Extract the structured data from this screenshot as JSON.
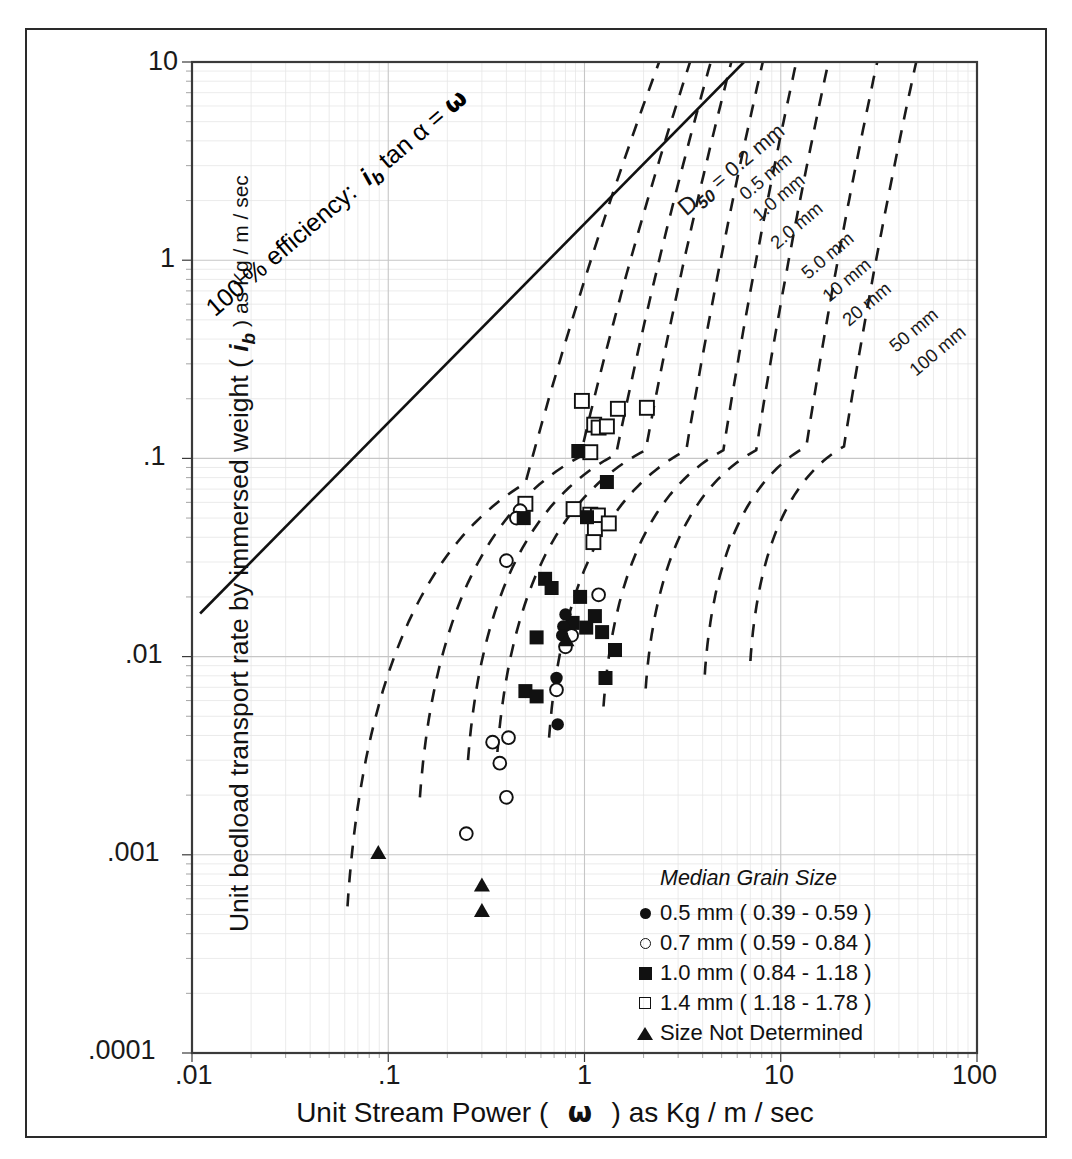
{
  "chart_data": {
    "type": "scatter",
    "title": "",
    "xlabel": "Unit Stream Power (  ω  ) as Kg / m / sec",
    "ylabel": "Unit bedload transport rate by immersed weight ( i b ) as Kg / m / sec",
    "xscale": "log",
    "yscale": "log",
    "xlim": [
      0.01,
      100
    ],
    "ylim": [
      0.0001,
      10
    ],
    "xticks": [
      ".01",
      ".1",
      "1",
      "10",
      "100"
    ],
    "yticks": [
      "10",
      "1",
      ".1",
      ".01",
      ".001",
      ".0001"
    ],
    "grid": true,
    "legend_position": "bottom-right",
    "series": [
      {
        "name": "0.5 mm ( 0.39 - 0.59 )",
        "marker": "filled-circle",
        "points": [
          [
            0.8,
            0.0163
          ],
          [
            0.78,
            0.0142
          ],
          [
            0.77,
            0.0128
          ],
          [
            0.72,
            0.0078
          ],
          [
            0.73,
            0.00455
          ]
        ]
      },
      {
        "name": "0.7 mm ( 0.59 - 0.84 )",
        "marker": "open-circle",
        "points": [
          [
            0.47,
            0.0545
          ],
          [
            0.45,
            0.05
          ],
          [
            0.4,
            0.0305
          ],
          [
            0.83,
            0.0133
          ],
          [
            0.86,
            0.0128
          ],
          [
            1.18,
            0.0205
          ],
          [
            0.8,
            0.0112
          ],
          [
            0.72,
            0.0068
          ],
          [
            0.34,
            0.0037
          ],
          [
            0.41,
            0.0039
          ],
          [
            0.37,
            0.0029
          ],
          [
            0.4,
            0.00195
          ],
          [
            0.25,
            0.00128
          ]
        ]
      },
      {
        "name": "1.0 mm ( 0.84 - 1.18 )",
        "marker": "filled-square",
        "points": [
          [
            0.93,
            0.109
          ],
          [
            1.3,
            0.076
          ],
          [
            0.49,
            0.05
          ],
          [
            1.03,
            0.0505
          ],
          [
            1.43,
            0.0108
          ],
          [
            0.63,
            0.0247
          ],
          [
            0.68,
            0.0222
          ],
          [
            0.95,
            0.02
          ],
          [
            1.13,
            0.016
          ],
          [
            0.87,
            0.0148
          ],
          [
            1.02,
            0.014
          ],
          [
            1.23,
            0.0133
          ],
          [
            0.57,
            0.0125
          ],
          [
            0.5,
            0.0067
          ],
          [
            0.57,
            0.0063
          ],
          [
            1.28,
            0.0078
          ]
        ]
      },
      {
        "name": "1.4 mm ( 1.18 - 1.78 )",
        "marker": "open-square",
        "points": [
          [
            0.97,
            0.195
          ],
          [
            1.48,
            0.178
          ],
          [
            2.08,
            0.18
          ],
          [
            1.12,
            0.148
          ],
          [
            1.18,
            0.143
          ],
          [
            1.3,
            0.145
          ],
          [
            1.07,
            0.1075
          ],
          [
            0.88,
            0.0555
          ],
          [
            1.07,
            0.052
          ],
          [
            1.17,
            0.0515
          ],
          [
            1.13,
            0.044
          ],
          [
            1.33,
            0.047
          ],
          [
            1.11,
            0.0378
          ],
          [
            0.5,
            0.059
          ]
        ]
      },
      {
        "name": "Size Not Determined",
        "marker": "filled-triangle",
        "points": [
          [
            0.089,
            0.00102
          ],
          [
            0.3,
            0.0007
          ],
          [
            0.3,
            0.00052
          ],
          [
            0.81,
            0.0121
          ]
        ]
      }
    ],
    "reference_line": {
      "label": "100 % efficiency:  i b  tan α = ω",
      "style": "solid",
      "points": [
        [
          0.011,
          0.0165
        ],
        [
          6.5,
          10.0
        ]
      ]
    },
    "curve_family_label": "D50 =",
    "curves": [
      {
        "label": "0.2 mm"
      },
      {
        "label": "0.5 mm"
      },
      {
        "label": "1.0 mm"
      },
      {
        "label": "2.0 mm"
      },
      {
        "label": "5.0 mm"
      },
      {
        "label": "10 mm"
      },
      {
        "label": "20 mm"
      },
      {
        "label": "50 mm"
      },
      {
        "label": "100 mm"
      }
    ]
  },
  "axes": {
    "x_title_pre": "Unit Stream Power  (",
    "x_title_omega": "ω",
    "x_title_post": ") as Kg / m / sec",
    "y_title_pre": "Unit bedload transport rate by immersed weight (",
    "y_title_ib": "i",
    "y_title_ib_sub": "b",
    "y_title_post": ") as Kg / m / sec",
    "x_ticks": [
      ".01",
      ".1",
      "1",
      "10",
      "100"
    ],
    "y_ticks": [
      "10",
      "1",
      ".1",
      ".01",
      ".001",
      ".0001"
    ]
  },
  "annotations": {
    "efficiency_pre": "100 % efficiency:",
    "efficiency_ib": "i",
    "efficiency_ib_sub": "b",
    "efficiency_post": "tan α =",
    "efficiency_omega": "ω",
    "d50_prefix": "D",
    "d50_sub": "50",
    "d50_eq": "= 0.2 mm",
    "curve_labels": [
      "0.5 mm",
      "1.0 mm",
      "2.0 mm",
      "5.0 mm",
      "10 mm",
      "20 mm",
      "50 mm",
      "100 mm"
    ]
  },
  "legend": {
    "title": "Median Grain Size",
    "items": [
      {
        "symbol": "filled-circle",
        "label": "0.5 mm ( 0.39 - 0.59 )"
      },
      {
        "symbol": "open-circle",
        "label": "0.7 mm ( 0.59 - 0.84 )"
      },
      {
        "symbol": "filled-square",
        "label": "1.0 mm ( 0.84 - 1.18 )"
      },
      {
        "symbol": "open-square",
        "label": "1.4 mm ( 1.18 - 1.78 )"
      },
      {
        "symbol": "filled-triangle",
        "label": "Size Not Determined"
      }
    ]
  },
  "colors": {
    "frame": "#2a2a2a",
    "axis": "#3a3a3a",
    "grid_major": "#c9c9c9",
    "grid_minor": "#e4e4e4",
    "marker": "#111111",
    "curve": "#1a1a1a"
  }
}
